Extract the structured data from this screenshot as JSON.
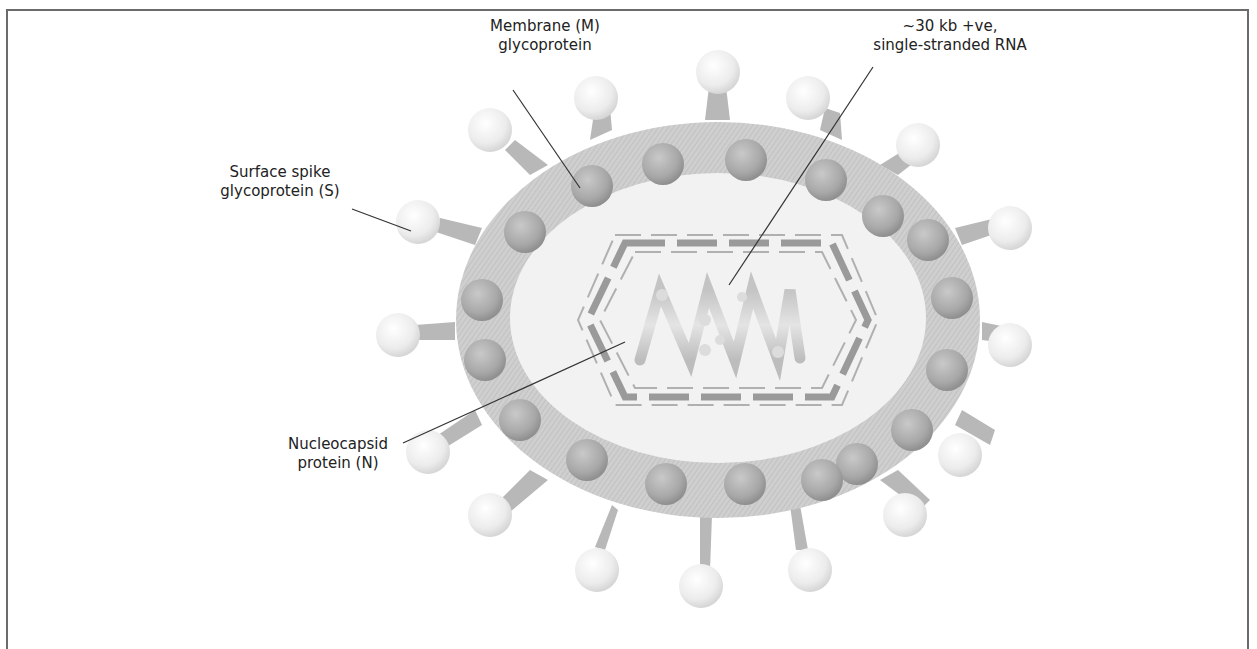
{
  "figure": {
    "type": "coronavirus structure diagram",
    "palette": {
      "border": "#6b6b6b",
      "envelope": "#c8c8c8",
      "core": "#f1f1f1",
      "membrane_protein": "#a9a9a9",
      "spike_stalk": "#b8b8b8",
      "spike_head": "#ececec",
      "nucleocapsid_dash": "#9a9a9a",
      "leader_line": "#333333"
    }
  },
  "labels": {
    "membrane": {
      "line1": "Membrane (M)",
      "line2": "glycoprotein"
    },
    "rna": {
      "line1": "~30 kb +ve,",
      "line2": "single-stranded RNA"
    },
    "spike": {
      "line1": "Surface spike",
      "line2": "glycoprotein (S)"
    },
    "nucleocapsid": {
      "line1": "Nucleocapsid",
      "line2": "protein (N)"
    }
  }
}
